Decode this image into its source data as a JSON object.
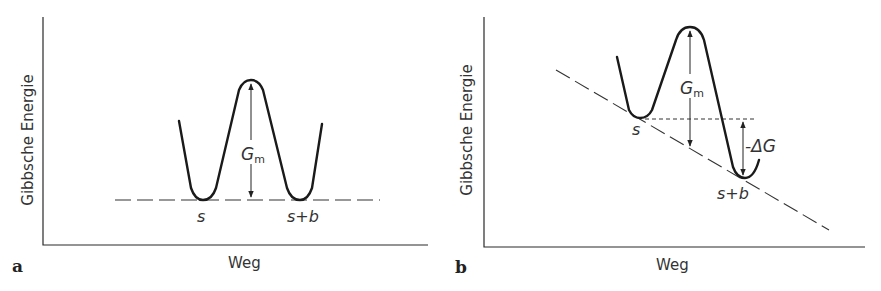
{
  "figure": {
    "panels": [
      {
        "id": "a",
        "panel_label": "a",
        "y_axis_label": "Gibbsche Energie",
        "x_axis_label": "Weg",
        "state_left": "s",
        "state_right": "s+b",
        "barrier_label": "G",
        "barrier_subscript": "m"
      },
      {
        "id": "b",
        "panel_label": "b",
        "y_axis_label": "Gibbsche Energie",
        "x_axis_label": "Weg",
        "state_left": "s",
        "state_right": "s+b",
        "barrier_label": "G",
        "barrier_subscript": "m",
        "delta_label": "-ΔG"
      }
    ]
  }
}
